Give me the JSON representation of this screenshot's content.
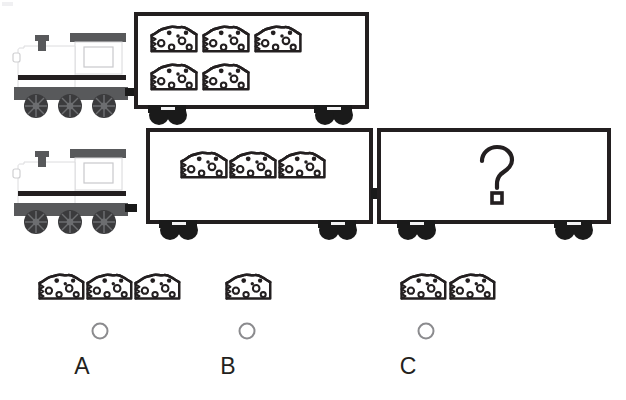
{
  "page": {
    "background_color": "#ffffff",
    "width": 626,
    "height": 400
  },
  "colors": {
    "outline": "#231f20",
    "loco_body": "#ffffff",
    "loco_roof": "#58595b",
    "loco_base": "#58595b",
    "loco_stripe": "#231f20",
    "wheel_dark": "#3b3b3d",
    "wagon_fill": "#ffffff",
    "wagon_wheel": "#1a1a1a",
    "radio_stroke": "#8b8b8e",
    "letter_color": "#231f20"
  },
  "rows": [
    {
      "id": "row-top",
      "name": "top-train-row",
      "locomotive": {
        "name": "locomotive",
        "wheels": 3,
        "has_chimney": true,
        "has_cab_window": true
      },
      "wagons": [
        {
          "name": "wagon-top-1",
          "content_type": "cheese",
          "cheese_count": 5,
          "cheese_layout": [
            3,
            2
          ]
        }
      ]
    },
    {
      "id": "row-bottom",
      "name": "bottom-train-row",
      "locomotive": {
        "name": "locomotive",
        "wheels": 3,
        "has_chimney": true,
        "has_cab_window": true
      },
      "wagons": [
        {
          "name": "wagon-bottom-1",
          "content_type": "cheese",
          "cheese_count": 3,
          "cheese_layout": [
            3
          ]
        },
        {
          "name": "wagon-bottom-2-unknown",
          "content_type": "question",
          "question_symbol": "?",
          "cheese_count": 0
        }
      ]
    }
  ],
  "answer_options": [
    {
      "id": "A",
      "name": "answer-option-a",
      "label": "A",
      "cheese_count": 3,
      "selected": false,
      "letter_x": 82,
      "letter_y": 355,
      "radio_cx": 100,
      "radio_cy": 331
    },
    {
      "id": "B",
      "name": "answer-option-b",
      "label": "B",
      "cheese_count": 1,
      "selected": false,
      "letter_x": 228,
      "letter_y": 355,
      "radio_cx": 247,
      "radio_cy": 331
    },
    {
      "id": "C",
      "name": "answer-option-c",
      "label": "C",
      "cheese_count": 2,
      "selected": false,
      "letter_x": 408,
      "letter_y": 355,
      "radio_cx": 426,
      "radio_cy": 331
    }
  ],
  "icons": {
    "cheese": "cheese-wedge-icon",
    "question": "question-mark-icon",
    "radio": "radio-button-icon",
    "train": "train-locomotive-icon",
    "wagon": "train-wagon-icon",
    "wheel": "train-wheel-icon",
    "chimney": "chimney-icon"
  }
}
